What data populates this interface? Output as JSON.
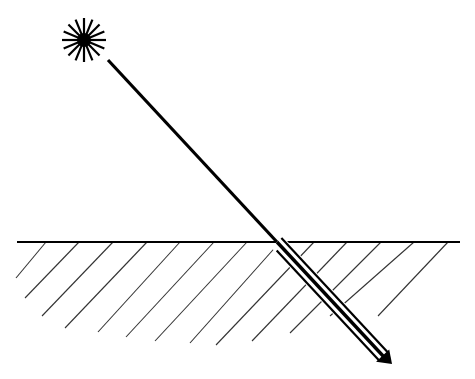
{
  "diagram": {
    "type": "light-ray-refraction",
    "colors": {
      "stroke": "#000000",
      "hatch": "#333333",
      "background": "#ffffff"
    },
    "light_source": {
      "name": "sun",
      "cx": 84,
      "cy": 40,
      "core_radius": 7,
      "ray_count": 16,
      "ray_length": 22
    },
    "incident_ray": {
      "x1": 108,
      "y1": 60,
      "x2": 277,
      "y2": 242
    },
    "surface": {
      "x1": 17,
      "y1": 242,
      "x2": 460,
      "y2": 242
    },
    "refracted_beam": {
      "x1": 277,
      "y1": 242,
      "x2": 384,
      "y2": 357,
      "tip_x": 392,
      "tip_y": 364
    },
    "hatch_lines": [
      {
        "x1": 46,
        "y1": 242,
        "x2": 16,
        "y2": 278
      },
      {
        "x1": 79,
        "y1": 242,
        "x2": 25,
        "y2": 298
      },
      {
        "x1": 113,
        "y1": 242,
        "x2": 42,
        "y2": 316
      },
      {
        "x1": 147,
        "y1": 242,
        "x2": 65,
        "y2": 328
      },
      {
        "x1": 180,
        "y1": 242,
        "x2": 98,
        "y2": 332
      },
      {
        "x1": 214,
        "y1": 242,
        "x2": 126,
        "y2": 337
      },
      {
        "x1": 247,
        "y1": 242,
        "x2": 155,
        "y2": 341
      },
      {
        "x1": 280,
        "y1": 242,
        "x2": 190,
        "y2": 343
      },
      {
        "x1": 314,
        "y1": 242,
        "x2": 216,
        "y2": 345
      },
      {
        "x1": 347,
        "y1": 242,
        "x2": 252,
        "y2": 341
      },
      {
        "x1": 381,
        "y1": 242,
        "x2": 290,
        "y2": 333
      },
      {
        "x1": 414,
        "y1": 242,
        "x2": 330,
        "y2": 316
      },
      {
        "x1": 448,
        "y1": 242,
        "x2": 378,
        "y2": 316
      }
    ]
  }
}
